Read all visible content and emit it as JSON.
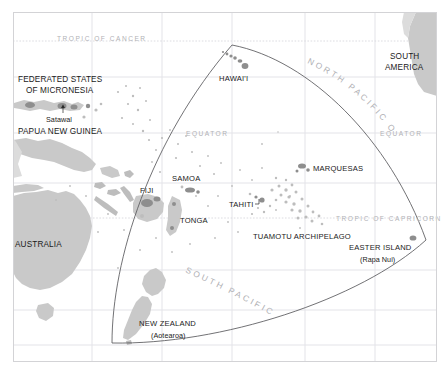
{
  "map": {
    "title": "Polynesian Triangle — Pacific Ocean reference map",
    "frame": {
      "x": 13,
      "y": 12,
      "width": 424,
      "height": 350
    },
    "colors": {
      "ocean": "#ffffff",
      "land": "#c9c9c9",
      "land_dark": "#8e8e8e",
      "gridline": "#e3e3e8",
      "frame": "#d3d3d6",
      "triangle": "#58585c",
      "label_dark": "#1a1a1a",
      "label_ocean": "#b0b0b4",
      "label_latitude": "#b2b2b6"
    },
    "latitude_lines": [
      {
        "name": "tropic-of-cancer",
        "label": "TROPIC OF CANCER",
        "y": 41,
        "label_x": 57,
        "style": "dotted"
      },
      {
        "name": "equator-left",
        "label": "EQUATOR",
        "y": 133,
        "label_x": 186,
        "style": "solid"
      },
      {
        "name": "equator-right",
        "label": "EQUATOR",
        "y": 133,
        "label_x": 380,
        "style": "solid"
      },
      {
        "name": "tropic-of-capricorn",
        "label": "TROPIC OF CAPRICORN",
        "y": 218,
        "label_x": 336,
        "style": "dotted"
      }
    ],
    "grid": {
      "vertical_x": [
        92,
        162,
        232,
        305,
        375
      ],
      "horizontal_y": [
        41,
        77,
        133,
        183,
        218,
        270,
        310,
        345
      ]
    },
    "ocean_labels": [
      {
        "name": "north-pacific-ocean",
        "text": "NORTH PACIFIC OCEAN"
      },
      {
        "name": "south-pacific-ocean",
        "text": "SOUTH PACIFIC OCEAN"
      }
    ],
    "place_labels": [
      {
        "name": "federated-states-of-micronesia",
        "line1": "FEDERATED STATES",
        "line2": "OF MICRONESIA",
        "x": 18,
        "y": 82,
        "class": "lbl-country"
      },
      {
        "name": "satawal",
        "text": "Satawal",
        "x": 46,
        "y": 120,
        "class": "lbl-sub"
      },
      {
        "name": "papua-new-guinea",
        "text": "PAPUA NEW GUINEA",
        "x": 18,
        "y": 133,
        "class": "lbl-country"
      },
      {
        "name": "australia",
        "text": "AUSTRALIA",
        "x": 15,
        "y": 244,
        "class": "lbl-country"
      },
      {
        "name": "hawaii",
        "text": "HAWAI'I",
        "x": 219,
        "y": 80,
        "class": "lbl-island"
      },
      {
        "name": "south-america",
        "line1": "SOUTH",
        "line2": "AMERICA",
        "x": 390,
        "y": 58,
        "class": "lbl-country"
      },
      {
        "name": "marquesas",
        "text": "MARQUESAS",
        "x": 313,
        "y": 170,
        "class": "lbl-island"
      },
      {
        "name": "samoa",
        "text": "SAMOA",
        "x": 174,
        "y": 180,
        "class": "lbl-island"
      },
      {
        "name": "fiji",
        "text": "FIJI",
        "x": 141,
        "y": 192,
        "class": "lbl-island"
      },
      {
        "name": "tonga",
        "text": "TONGA",
        "x": 180,
        "y": 222,
        "class": "lbl-island"
      },
      {
        "name": "tahiti",
        "text": "TAHITI",
        "x": 230,
        "y": 207,
        "class": "lbl-island"
      },
      {
        "name": "tuamotu-archipelago",
        "text": "TUAMOTU ARCHIPELAGO",
        "x": 255,
        "y": 238,
        "class": "lbl-island"
      },
      {
        "name": "easter-island",
        "text": "EASTER ISLAND",
        "x": 350,
        "y": 249,
        "class": "lbl-island"
      },
      {
        "name": "rapa-nui",
        "text": "(Rapa Nui)",
        "x": 360,
        "y": 261,
        "class": "lbl-sub"
      },
      {
        "name": "new-zealand",
        "text": "NEW ZEALAND",
        "x": 140,
        "y": 325,
        "class": "lbl-island"
      },
      {
        "name": "aotearoa",
        "text": "(Aotearoa)",
        "x": 152,
        "y": 337,
        "class": "lbl-sub"
      }
    ],
    "polynesian_triangle": {
      "name": "polynesian-triangle",
      "vertices": [
        {
          "label": "Hawai'i apex",
          "x": 232,
          "y": 45
        },
        {
          "label": "Easter Island",
          "x": 426,
          "y": 240
        },
        {
          "label": "Aotearoa / New Zealand",
          "x": 112,
          "y": 343
        }
      ]
    }
  }
}
